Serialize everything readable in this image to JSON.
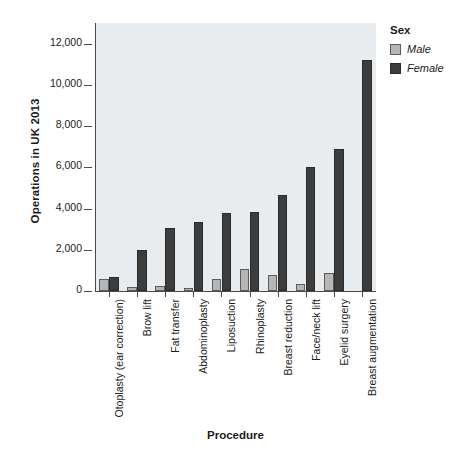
{
  "chart_data": {
    "type": "bar",
    "title": "",
    "xlabel": "Procedure",
    "ylabel": "Operations in UK 2013",
    "ylim": [
      0,
      13000
    ],
    "yticks": [
      "0",
      "2,000",
      "4,000",
      "6,000",
      "8,000",
      "10,000",
      "12,000"
    ],
    "ytick_values": [
      0,
      2000,
      4000,
      6000,
      8000,
      10000,
      12000
    ],
    "grid": false,
    "legend_position": "right",
    "legend_title": "Sex",
    "categories": [
      "Otoplasty (ear correction)",
      "Brow lift",
      "Fat transfer",
      "Abdominoplasty",
      "Liposuction",
      "Rhinoplasty",
      "Breast reduction",
      "Face/neck lift",
      "Eyelid surgery",
      "Breast augmentation"
    ],
    "series": [
      {
        "name": "Male",
        "color": "#b6b6b6",
        "values": [
          560,
          180,
          220,
          130,
          600,
          1050,
          800,
          330,
          880,
          0
        ]
      },
      {
        "name": "Female",
        "color": "#3d3d3d",
        "values": [
          660,
          1990,
          3040,
          3350,
          3780,
          3820,
          4680,
          6000,
          6900,
          11200
        ]
      }
    ]
  },
  "legend": {
    "title": "Sex",
    "entries": [
      {
        "label": "Male",
        "swatch": "male-swatch"
      },
      {
        "label": "Female",
        "swatch": "female-swatch"
      }
    ]
  },
  "axes": {
    "y_title": "Operations in UK 2013",
    "x_title": "Procedure"
  }
}
